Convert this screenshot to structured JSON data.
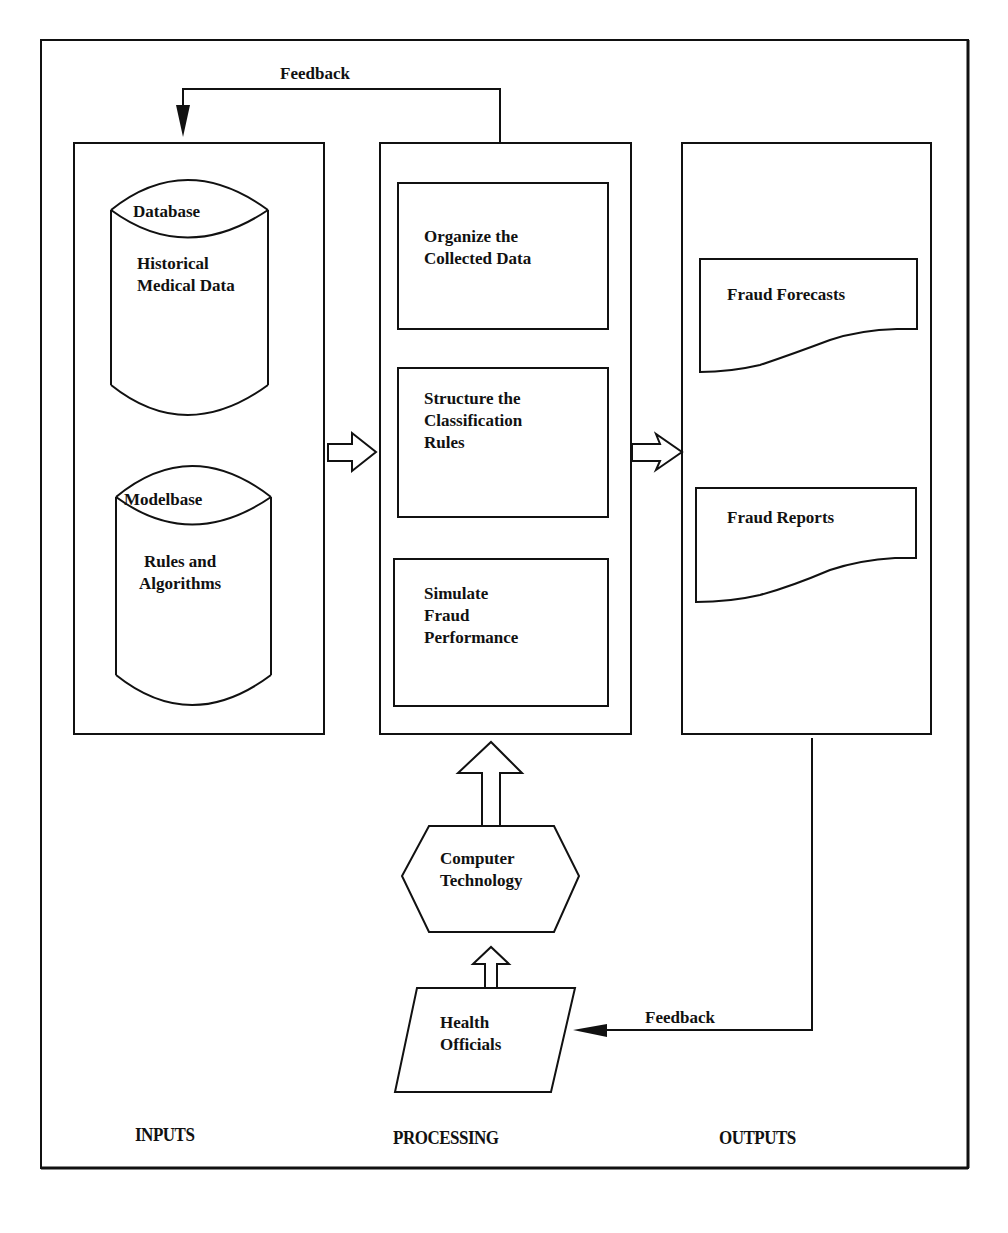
{
  "diagram": {
    "colors": {
      "stroke": "#111111",
      "background": "#ffffff"
    },
    "feedback_top": {
      "label": "Feedback"
    },
    "feedback_bottom": {
      "label": "Feedback"
    },
    "inputs": {
      "caption": "INPUTS",
      "database": {
        "header": "Database",
        "line1": "Historical",
        "line2": "Medical Data"
      },
      "modelbase": {
        "header": "Modelbase",
        "line1": "Rules and",
        "line2": "Algorithms"
      }
    },
    "processing": {
      "caption": "PROCESSING",
      "steps": [
        {
          "line1": "Organize the",
          "line2": "Collected Data"
        },
        {
          "line1": "Structure the",
          "line2": "Classification",
          "line3": "Rules"
        },
        {
          "line1": "Simulate",
          "line2": "Fraud",
          "line3": "Performance"
        }
      ]
    },
    "outputs": {
      "caption": "OUTPUTS",
      "documents": [
        {
          "label": "Fraud Forecasts"
        },
        {
          "label": "Fraud Reports"
        }
      ]
    },
    "computer_technology": {
      "line1": "Computer",
      "line2": "Technology"
    },
    "health_officials": {
      "line1": "Health",
      "line2": "Officials"
    }
  }
}
